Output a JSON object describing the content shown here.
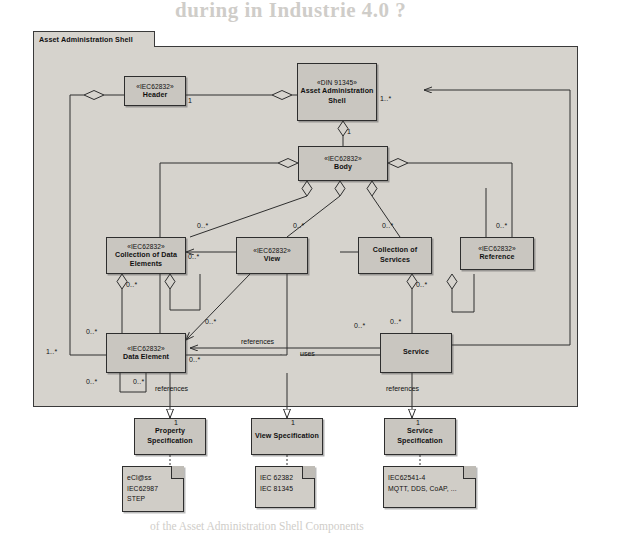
{
  "page_bleed": {
    "title": "during in Industrie 4.0 ?",
    "lines": [
      "consultation this again. In the main area of the Industrie",
      "set in the following sections sections I 4.0 at more suitable",
      "A communication for appropriate manner and",
      "",
      "ments, Component, to be able to be Com-",
      "tion properties and between the compo-",
      "ment of the components is",
      "of the Asset Administration Shell Components"
    ]
  },
  "package": {
    "title": "Asset Administration Shell"
  },
  "classes": [
    {
      "id": "header",
      "stereotype": "«IEC62832»",
      "name": "Header"
    },
    {
      "id": "aas",
      "stereotype": "«DIN 91345»",
      "name": "Asset Administration Shell"
    },
    {
      "id": "body",
      "stereotype": "«IEC62832»",
      "name": "Body"
    },
    {
      "id": "cde",
      "stereotype": "«IEC62832»",
      "name": "Collection of Data Elements"
    },
    {
      "id": "view",
      "stereotype": "«IEC62832»",
      "name": "View"
    },
    {
      "id": "cos",
      "stereotype": "",
      "name": "Collection of Services"
    },
    {
      "id": "reference",
      "stereotype": "«IEC62832»",
      "name": "Reference"
    },
    {
      "id": "dataelement",
      "stereotype": "«IEC62832»",
      "name": "Data Element"
    },
    {
      "id": "service",
      "stereotype": "",
      "name": "Service"
    },
    {
      "id": "propspec",
      "stereotype": "",
      "name": "Property Specification"
    },
    {
      "id": "viewspec",
      "stereotype": "",
      "name": "View Specification"
    },
    {
      "id": "servspec",
      "stereotype": "",
      "name": "Service Specification"
    }
  ],
  "notes": [
    {
      "id": "note-property",
      "lines": [
        "eCl@ss",
        "IEC62987",
        "STEP"
      ]
    },
    {
      "id": "note-view",
      "lines": [
        "IEC 62382",
        "IEC 81345"
      ]
    },
    {
      "id": "note-service",
      "lines": [
        "IEC62541-4",
        "MQTT, DDS, CoAP, ..."
      ]
    }
  ],
  "multiplicities": {
    "header_to_aas": "1",
    "aas_to_outer": "1..*",
    "aas_to_body": "1",
    "body_to_cde": "0..*",
    "body_to_view": "0..*",
    "body_to_cos": "0..*",
    "body_to_reference_right": "0..*",
    "cde_incoming": "0..*",
    "cde_to_dataelement": "0..*",
    "cos_to_service": "0..*",
    "view_to_dataelement": "0..*",
    "dataelement_left": "1..*",
    "dataelement_self_a": "0..*",
    "dataelement_self_b": "0..*",
    "dataelement_bottom": "0..*",
    "dataelement_to_service": "0..*",
    "service_in_a": "0..*",
    "service_in_b": "0..*",
    "propspec_mult": "1",
    "viewspec_mult": "1",
    "servspec_mult": "1"
  },
  "edge_labels": {
    "view_references_dataelement": "references",
    "service_uses_dataelement": "uses",
    "dataelement_references_propspec": "references",
    "service_references_servspec": "references"
  },
  "colors": {
    "package_fill": "#d6d3cd",
    "class_fill": "#c9c6c0",
    "note_fill": "#d0cdc7",
    "line": "#2e2e2e",
    "text": "#101010"
  }
}
